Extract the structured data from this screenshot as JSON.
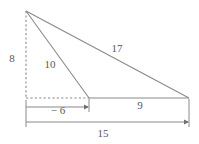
{
  "figure": {
    "type": "geometry-diagram",
    "width": 199,
    "height": 144,
    "background_color": "#ffffff",
    "stroke_color": "#8a8a8a",
    "text_color": "#58595b"
  },
  "points": {
    "apex": {
      "name": "apex",
      "x": 26,
      "y": 11
    },
    "foot": {
      "name": "altitude-foot",
      "x": 26,
      "y": 98
    },
    "mid": {
      "name": "mid-vertex",
      "x": 89,
      "y": 98
    },
    "right": {
      "name": "right-vertex",
      "x": 189,
      "y": 98
    }
  },
  "segments": [
    {
      "name": "hypotenuse-17",
      "from": "apex",
      "to": "right",
      "style": "solid"
    },
    {
      "name": "side-10",
      "from": "apex",
      "to": "mid",
      "style": "solid"
    },
    {
      "name": "baseline-9",
      "from": "mid",
      "to": "right",
      "style": "solid"
    },
    {
      "name": "altitude-8",
      "from": "apex",
      "to": "foot",
      "style": "dashed"
    },
    {
      "name": "base-extension-6",
      "from": "foot",
      "to": "mid",
      "style": "dashed"
    }
  ],
  "labels": {
    "altitude": {
      "text": "8",
      "x": 12,
      "y": 58
    },
    "side": {
      "text": "10",
      "x": 50,
      "y": 64
    },
    "hypotenuse": {
      "text": "17",
      "x": 117,
      "y": 48
    },
    "base_right": {
      "text": "9",
      "x": 140,
      "y": 105
    },
    "offset_left": {
      "text": "− 6",
      "x": 58,
      "y": 110
    },
    "base_total": {
      "text": "15",
      "x": 103,
      "y": 133
    }
  },
  "dimension_lines": [
    {
      "name": "dimension-minus-6",
      "value": "− 6",
      "y": 107,
      "x_start": 26,
      "x_end": 89,
      "arrow_end": "right"
    },
    {
      "name": "dimension-15",
      "value": "15",
      "y": 122,
      "x_start": 26,
      "x_end": 189,
      "arrow_end": "right"
    }
  ]
}
